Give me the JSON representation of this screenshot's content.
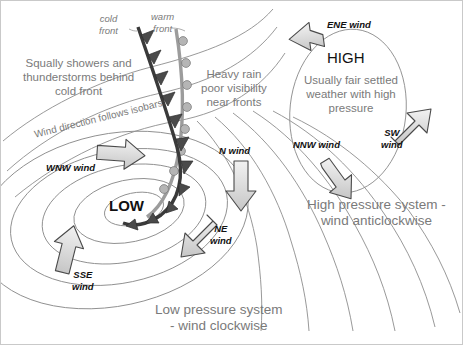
{
  "diagram": {
    "colors": {
      "isobar": "#8d8d8d",
      "grey_text": "#7a7a7a",
      "black_text": "#111111",
      "cold_front": "#3a3a3a",
      "warm_front": "#a0a0a0",
      "arrow_fill": "#d8d8d8",
      "arrow_stroke": "#4a4a4a",
      "border": "#c9c9c9",
      "background": "#ffffff"
    }
  },
  "front_labels": {
    "cold": "cold\nfront",
    "warm": "warm\nfront"
  },
  "annotations": {
    "squally": "Squally showers and\nthunderstorms behind\ncold front",
    "heavy_rain": "Heavy rain\npoor visibility\nnear fronts",
    "isobar_note": "Wind direction follows isobars",
    "high_desc": "Usually fair settled\nweather with high\npressure"
  },
  "pressure_centres": {
    "low": "LOW",
    "high": "HIGH"
  },
  "captions": {
    "low_caption": "Low pressure system\n- wind clockwise",
    "high_caption": "High pressure system -\nwind anticlockwise"
  },
  "wind_labels": [
    {
      "id": "wnw",
      "text": "WNW wind",
      "direction": "east"
    },
    {
      "id": "sse",
      "text": "SSE\nwind",
      "direction": "north-east"
    },
    {
      "id": "ne",
      "text": "NE\nwind",
      "direction": "south-west"
    },
    {
      "id": "n",
      "text": "N wind",
      "direction": "south"
    },
    {
      "id": "ene",
      "text": "ENE wind",
      "direction": "west"
    },
    {
      "id": "sw",
      "text": "SW\nwind",
      "direction": "north-east"
    },
    {
      "id": "nnw",
      "text": "NNW wind",
      "direction": "south-west"
    }
  ]
}
